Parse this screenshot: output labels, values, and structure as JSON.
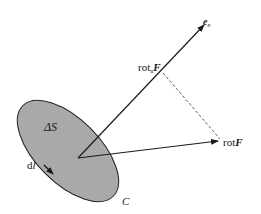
{
  "diagram": {
    "surface": {
      "label": "ΔS",
      "boundary_label": "C",
      "fill": "#a9a9a9",
      "stroke": "#222222"
    },
    "line_element": {
      "label_prefix": "d",
      "label_var": "l"
    },
    "normal_vector": {
      "label_base": "e",
      "label_sub": "n"
    },
    "projection": {
      "label_base": "rot",
      "label_sub": "n",
      "label_var": "F"
    },
    "curl_vector": {
      "label_base": "rot",
      "label_var": "F"
    },
    "colors": {
      "line": "#1a1a1a",
      "dashed": "#333333",
      "background": "#ffffff"
    }
  }
}
